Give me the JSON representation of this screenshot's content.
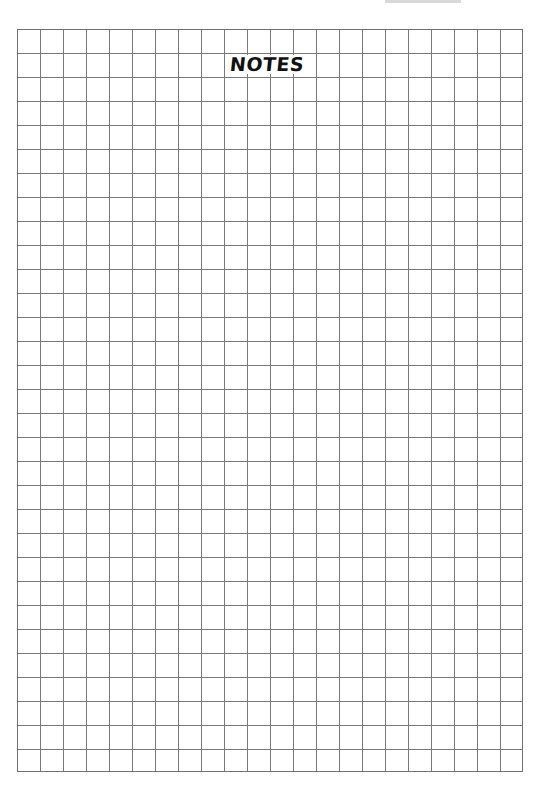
{
  "page": {
    "type": "graph-paper-notes",
    "title": "NOTES",
    "header_text_clipped": true
  },
  "grid": {
    "columns": 22,
    "rows": 31,
    "cell_width_px": 23,
    "cell_height_px": 24,
    "line_color": "#7a7a7a",
    "background_color": "#ffffff"
  },
  "colors": {
    "title_text": "#111111",
    "page_background": "#ffffff"
  }
}
